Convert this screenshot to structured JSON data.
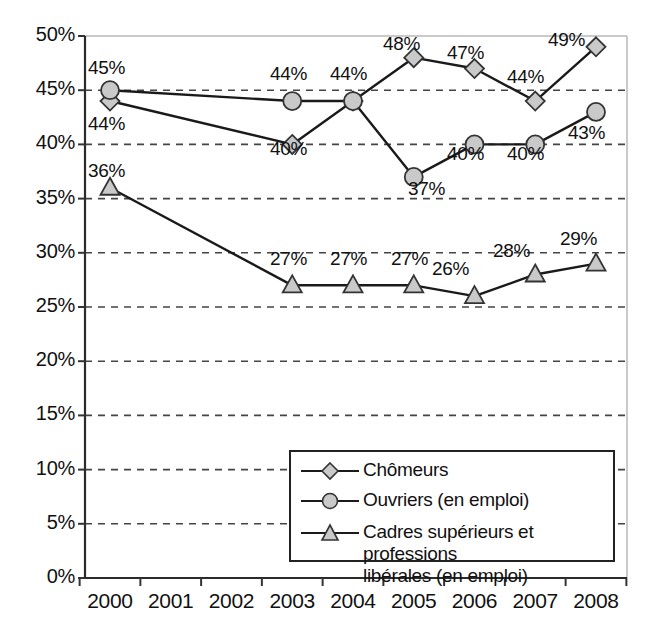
{
  "chart_data": {
    "type": "line",
    "title": "",
    "xlabel": "",
    "ylabel": "",
    "x": [
      "2000",
      "2001",
      "2002",
      "2003",
      "2004",
      "2005",
      "2006",
      "2007",
      "2008"
    ],
    "categories": [
      "2000",
      "2001",
      "2002",
      "2003",
      "2004",
      "2005",
      "2006",
      "2007",
      "2008"
    ],
    "ylim": [
      0,
      50
    ],
    "ytick_labels": [
      "0%",
      "5%",
      "10%",
      "15%",
      "20%",
      "25%",
      "30%",
      "35%",
      "40%",
      "45%",
      "50%"
    ],
    "ytick_values": [
      0,
      5,
      10,
      15,
      20,
      25,
      30,
      35,
      40,
      45,
      50
    ],
    "grid": "horizontal-dashed",
    "legend_position": "bottom-right-inside",
    "series": [
      {
        "name": "Chômeurs",
        "marker": "diamond",
        "x": [
          "2000",
          "2003",
          "2004",
          "2005",
          "2006",
          "2007",
          "2008"
        ],
        "values": [
          44,
          40,
          44,
          48,
          47,
          44,
          49
        ],
        "labels": [
          "44%",
          "40%",
          "44%",
          "48%",
          "47%",
          "44%",
          "49%"
        ]
      },
      {
        "name": "Ouvriers (en emploi)",
        "marker": "circle",
        "x": [
          "2000",
          "2003",
          "2004",
          "2005",
          "2006",
          "2007",
          "2008"
        ],
        "values": [
          45,
          44,
          44,
          37,
          40,
          40,
          43
        ],
        "labels": [
          "45%",
          "44%",
          "44%",
          "37%",
          "40%",
          "40%",
          "43%"
        ]
      },
      {
        "name": "Cadres supérieurs et professions libérales (en emploi)",
        "marker": "triangle",
        "x": [
          "2000",
          "2003",
          "2004",
          "2005",
          "2006",
          "2007",
          "2008"
        ],
        "values": [
          36,
          27,
          27,
          27,
          26,
          28,
          29
        ],
        "labels": [
          "36%",
          "27%",
          "27%",
          "27%",
          "26%",
          "28%",
          "29%"
        ]
      }
    ],
    "point_labels": [
      {
        "text": "45%",
        "x": 88,
        "y": 57
      },
      {
        "text": "44%",
        "x": 88,
        "y": 113
      },
      {
        "text": "36%",
        "x": 88,
        "y": 160
      },
      {
        "text": "44%",
        "x": 270,
        "y": 63
      },
      {
        "text": "40%",
        "x": 270,
        "y": 138
      },
      {
        "text": "27%",
        "x": 270,
        "y": 248
      },
      {
        "text": "44%",
        "x": 330,
        "y": 63
      },
      {
        "text": "27%",
        "x": 330,
        "y": 248
      },
      {
        "text": "48%",
        "x": 383,
        "y": 33
      },
      {
        "text": "37%",
        "x": 408,
        "y": 178
      },
      {
        "text": "27%",
        "x": 391,
        "y": 248
      },
      {
        "text": "47%",
        "x": 447,
        "y": 42
      },
      {
        "text": "40%",
        "x": 447,
        "y": 143
      },
      {
        "text": "26%",
        "x": 432,
        "y": 258
      },
      {
        "text": "44%",
        "x": 507,
        "y": 66
      },
      {
        "text": "40%",
        "x": 507,
        "y": 143
      },
      {
        "text": "28%",
        "x": 493,
        "y": 240
      },
      {
        "text": "49%",
        "x": 548,
        "y": 29
      },
      {
        "text": "43%",
        "x": 568,
        "y": 122
      },
      {
        "text": "29%",
        "x": 560,
        "y": 228
      }
    ],
    "legend": {
      "entries": [
        {
          "label": "Chômeurs",
          "marker": "diamond"
        },
        {
          "label": "Ouvriers (en emploi)",
          "marker": "circle"
        },
        {
          "label_line1": "Cadres supérieurs et professions",
          "label_line2": "libérales (en emploi)",
          "marker": "triangle"
        }
      ]
    },
    "colors": {
      "line": "#1a1a1a",
      "marker_fill": "#c9c9c9",
      "marker_stroke": "#333333",
      "grid": "#444444",
      "frame": "#b8b8b8",
      "axis": "#333333",
      "text": "#111111",
      "background": "#ffffff"
    }
  }
}
